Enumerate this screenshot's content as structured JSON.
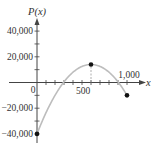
{
  "chart_data": {
    "type": "line",
    "title": "",
    "xlabel": "x",
    "ylabel": "P(x)",
    "xlim": [
      0,
      1000
    ],
    "ylim": [
      -40000,
      40000
    ],
    "x_tick_step": 100,
    "y_tick_step": 10000,
    "x_tick_labels": [
      {
        "value": 0,
        "label": "0"
      },
      {
        "value": 500,
        "label": "500"
      },
      {
        "value": 1000,
        "label": "1,000"
      }
    ],
    "y_tick_labels": [
      {
        "value": 40000,
        "label": "40,000"
      },
      {
        "value": 20000,
        "label": "20,000"
      },
      {
        "value": -20000,
        "label": "−20,000"
      },
      {
        "value": -40000,
        "label": "−40,000"
      }
    ],
    "grid": false,
    "legend": null,
    "series": [
      {
        "name": "P(x)",
        "curve": "parabola",
        "color": "#bdbdbd",
        "x": [
          0,
          100,
          200,
          300,
          400,
          500,
          600,
          700,
          800,
          900,
          1000
        ],
        "values": [
          -40000,
          -23500,
          -10000,
          500,
          8000,
          12500,
          14000,
          12500,
          8000,
          500,
          -10000
        ]
      }
    ],
    "marked_points": [
      {
        "x": 0,
        "y": -40000
      },
      {
        "x": 600,
        "y": 14000
      },
      {
        "x": 1000,
        "y": -10000
      }
    ],
    "annotations": [
      {
        "type": "dashed-vertical",
        "x": 600,
        "from_y": 0,
        "to_y": 14000
      }
    ]
  },
  "colors": {
    "axis": "#444444",
    "curve": "#bdbdbd",
    "point": "#111111",
    "dashed": "#999999"
  }
}
